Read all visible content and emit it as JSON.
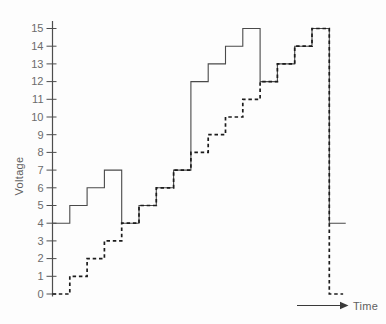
{
  "chart_data": {
    "type": "line",
    "subtype": "step-waveform",
    "title": "",
    "xlabel": "Time",
    "ylabel": "Voltage",
    "ylim": [
      0,
      15
    ],
    "y_ticks": [
      0,
      1,
      2,
      3,
      4,
      5,
      6,
      7,
      8,
      9,
      10,
      11,
      12,
      13,
      14,
      15
    ],
    "grid": false,
    "legend": "none",
    "x_axis_style": "arrow-only, unlabeled time axis at bottom right",
    "series": [
      {
        "name": "solid-waveform",
        "line_style": "solid",
        "color": "#4a4a4a",
        "stroke_width": 1.1,
        "step_values": [
          4,
          5,
          6,
          7,
          4,
          5,
          6,
          7,
          12,
          13,
          14,
          15,
          12,
          13,
          14,
          15
        ],
        "end_value": 4,
        "end_segment_len": 0.95,
        "description": "thin solid staircase: steps 4-7, drops to 4, steps 4-7, jumps to 12, steps 12-15, drops to 12, steps 12-15, drops to 4"
      },
      {
        "name": "dashed-staircase",
        "line_style": "dashed",
        "color": "#1c1c1c",
        "stroke_width": 1.7,
        "dash_pattern": [
          3.5,
          2.8
        ],
        "step_values": [
          0,
          1,
          2,
          3,
          4,
          5,
          6,
          7,
          8,
          9,
          10,
          11,
          12,
          13,
          14,
          15
        ],
        "end_value": 0,
        "end_segment_len": 0.8,
        "description": "bold dashed staircase rising 0 to 15 in unit steps, then dropping back to 0"
      }
    ]
  },
  "axis_colors": {
    "axis_line": "#4d4d4d",
    "tick": "#4d4d4d",
    "arrow": "#3a3a3a"
  }
}
